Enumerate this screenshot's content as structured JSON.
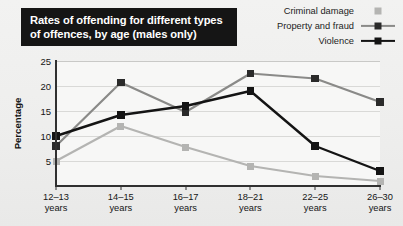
{
  "title": {
    "text": "Rates of offending for different types of offences, by age (males only)"
  },
  "legend": {
    "position": "top-right",
    "items": [
      {
        "label": "Criminal damage",
        "color": "#b4b4b2",
        "marker": "square",
        "line": false
      },
      {
        "label": "Property and fraud",
        "color": "#8a8a88",
        "marker": "square",
        "line": true
      },
      {
        "label": "Violence",
        "color": "#141414",
        "marker": "square",
        "line": true
      }
    ]
  },
  "axes": {
    "ylabel": "Percentage",
    "yticks": [
      5,
      10,
      15,
      20,
      25
    ],
    "ymin": 0,
    "ymax": 25,
    "xticklabels": [
      [
        "12–13",
        "years"
      ],
      [
        "14–15",
        "years"
      ],
      [
        "16–17",
        "years"
      ],
      [
        "18–21",
        "years"
      ],
      [
        "22–25",
        "years"
      ],
      [
        "26–30",
        "years"
      ]
    ]
  },
  "chart_data": {
    "type": "line",
    "title": "Rates of offending for different types of offences, by age (males only)",
    "xlabel": "",
    "ylabel": "Percentage",
    "ylim": [
      0,
      25
    ],
    "yticks": [
      5,
      10,
      15,
      20,
      25
    ],
    "grid": true,
    "legend_position": "top-right",
    "categories": [
      "12-13 years",
      "14-15 years",
      "16-17 years",
      "18-21 years",
      "22-25 years",
      "26-30 years"
    ],
    "series": [
      {
        "name": "Criminal damage",
        "color": "#b4b4b2",
        "values": [
          5,
          12,
          7.8,
          4,
          2,
          1
        ]
      },
      {
        "name": "Property and fraud",
        "color": "#8a8a88",
        "values": [
          8,
          20.7,
          14.8,
          22.5,
          21.5,
          16.8
        ]
      },
      {
        "name": "Violence",
        "color": "#141414",
        "values": [
          10,
          14.2,
          16,
          19,
          8,
          3
        ]
      }
    ]
  },
  "colors": {
    "page_background": "#efefee",
    "plot_background": "#f7f7f6",
    "gridline": "#d9d9d7",
    "axis": "#303030",
    "title_background": "#151515",
    "title_text": "#ffffff"
  }
}
